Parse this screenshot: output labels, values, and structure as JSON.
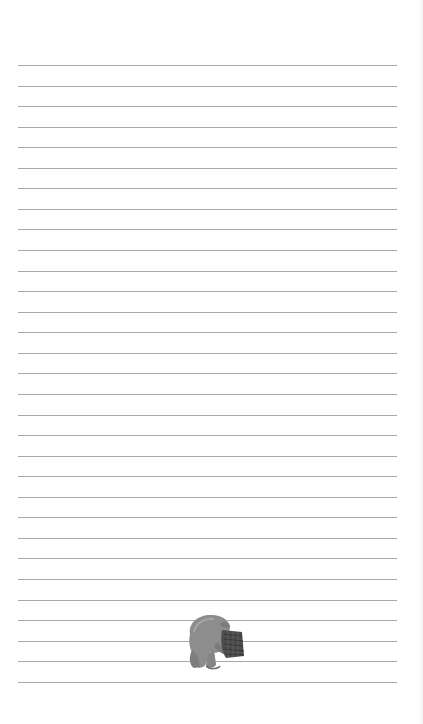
{
  "page": {
    "type": "lined-notepaper",
    "line_count": 31,
    "line_top": 65,
    "line_spacing": 20.56,
    "line_color": "#a9a9a9",
    "background": "#ffffff"
  },
  "illustration": {
    "subject": "bear-with-head-in-honey-pot",
    "colors": {
      "bear": "#8a8a8a",
      "pot": "#4a4a4a"
    }
  }
}
